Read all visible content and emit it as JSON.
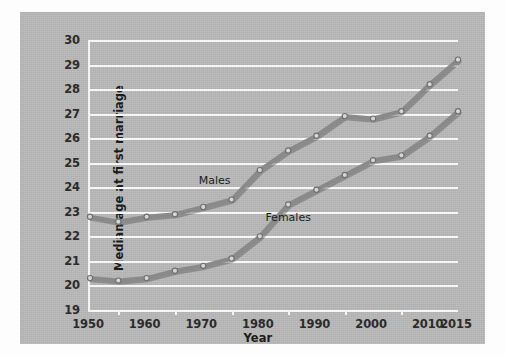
{
  "chart_data": {
    "type": "line",
    "title": "",
    "xlabel": "Year",
    "ylabel": "Median age at first marriage",
    "xlim": [
      1950,
      2015
    ],
    "ylim": [
      19,
      30
    ],
    "xticks": [
      1950,
      1960,
      1970,
      1980,
      1990,
      2000,
      2010,
      2015
    ],
    "xtick_labels": [
      "1950",
      "1960",
      "1970",
      "1980",
      "1990",
      "2000",
      "2010",
      "2015"
    ],
    "xticks_minor": [
      1955,
      1965,
      1975,
      1985,
      1995,
      2005
    ],
    "yticks": [
      19,
      20,
      21,
      22,
      23,
      24,
      25,
      26,
      27,
      28,
      29,
      30
    ],
    "ytick_labels": [
      "19",
      "20",
      "21",
      "22",
      "23",
      "24",
      "25",
      "26",
      "27",
      "28",
      "29",
      "30"
    ],
    "grid": true,
    "legend_position": "inline-labels",
    "x": [
      1950,
      1955,
      1960,
      1965,
      1970,
      1975,
      1980,
      1985,
      1990,
      1995,
      2000,
      2005,
      2010,
      2015
    ],
    "series": [
      {
        "name": "Males",
        "label_x": 1972,
        "label_y": 24.3,
        "values": [
          22.8,
          22.6,
          22.8,
          22.9,
          23.2,
          23.5,
          24.7,
          25.5,
          26.1,
          26.9,
          26.8,
          27.1,
          28.2,
          29.2
        ]
      },
      {
        "name": "Females",
        "label_x": 1985,
        "label_y": 22.8,
        "values": [
          20.3,
          20.2,
          20.3,
          20.6,
          20.8,
          21.1,
          22.0,
          23.3,
          23.9,
          24.5,
          25.1,
          25.3,
          26.1,
          27.1
        ]
      }
    ],
    "colors": {
      "panel_background": "#b9b9b9",
      "gridline": "#f6f6f6",
      "axis": "#f4f4f4",
      "line": "#8a8a8a",
      "marker_fill": "#d6d6d6",
      "marker_edge": "#6f6f6f",
      "text": "#1c1c1c"
    }
  }
}
